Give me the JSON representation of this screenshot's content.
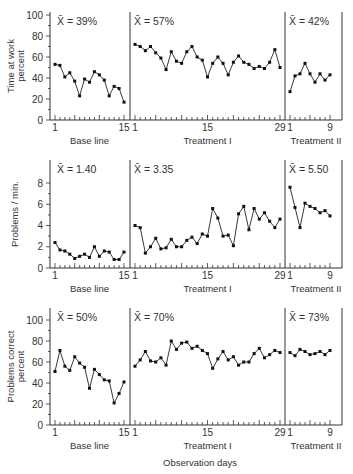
{
  "chart_data": [
    {
      "type": "line",
      "title": "Time at work percent",
      "ylabel": "Time at work percent",
      "ylim": [
        0,
        100
      ],
      "yticks": [
        0,
        20,
        40,
        60,
        80,
        100
      ],
      "phases": [
        {
          "name": "Base line",
          "mean_label": "X̄ = 39%",
          "x_ticks_labeled": [
            1,
            15
          ],
          "values": [
            53,
            52,
            41,
            45,
            37,
            23,
            39,
            36,
            46,
            43,
            38,
            23,
            32,
            30,
            17
          ]
        },
        {
          "name": "Treatment I",
          "mean_label": "X̄ = 57%",
          "x_ticks_labeled": [
            1,
            15,
            29
          ],
          "values": [
            72,
            70,
            66,
            70,
            64,
            59,
            48,
            65,
            56,
            54,
            65,
            70,
            60,
            57,
            41,
            54,
            60,
            54,
            43,
            55,
            61,
            55,
            53,
            49,
            51,
            49,
            55,
            67,
            50
          ]
        },
        {
          "name": "Treatment II",
          "mean_label": "X̄ = 42%",
          "x_ticks_labeled": [
            1,
            9
          ],
          "values": [
            27,
            42,
            44,
            54,
            44,
            36,
            44,
            38,
            43
          ]
        }
      ]
    },
    {
      "type": "line",
      "title": "Problems/min.",
      "ylabel": "Problems / min.",
      "ylim": [
        0,
        10
      ],
      "yticks": [
        0,
        2,
        4,
        6,
        8
      ],
      "phases": [
        {
          "name": "Base line",
          "mean_label": "X̄ = 1.40",
          "x_ticks_labeled": [
            1,
            15
          ],
          "values": [
            2.4,
            1.7,
            1.6,
            1.3,
            0.9,
            1.1,
            1.3,
            1.0,
            2.0,
            1.1,
            1.6,
            1.5,
            0.8,
            0.8,
            1.5
          ]
        },
        {
          "name": "Treatment I",
          "mean_label": "X̄ = 3.35",
          "x_ticks_labeled": [
            1,
            15,
            29
          ],
          "values": [
            4.0,
            3.8,
            1.4,
            2.0,
            2.8,
            1.8,
            1.9,
            2.7,
            2.0,
            2.0,
            2.6,
            2.9,
            2.3,
            3.2,
            3.0,
            5.6,
            4.7,
            3.0,
            3.1,
            2.1,
            5.1,
            5.8,
            3.6,
            5.6,
            4.6,
            5.2,
            4.4,
            3.8,
            4.6
          ]
        },
        {
          "name": "Treatment II",
          "mean_label": "X̄ = 5.50",
          "x_ticks_labeled": [
            1,
            9
          ],
          "values": [
            7.6,
            5.7,
            3.8,
            6.1,
            5.8,
            5.6,
            5.2,
            5.4,
            4.9
          ]
        }
      ]
    },
    {
      "type": "line",
      "title": "Problems correct percent",
      "ylabel": "Problems correct percent",
      "ylim": [
        0,
        100
      ],
      "yticks": [
        0,
        20,
        40,
        60,
        80,
        100
      ],
      "xlabel": "Observation days",
      "phases": [
        {
          "name": "Base line",
          "mean_label": "X̄ = 50%",
          "x_ticks_labeled": [
            1,
            15
          ],
          "values": [
            51,
            71,
            56,
            52,
            65,
            59,
            55,
            35,
            53,
            48,
            43,
            42,
            21,
            30,
            41
          ]
        },
        {
          "name": "Treatment I",
          "mean_label": "X̄ = 70%",
          "x_ticks_labeled": [
            1,
            15,
            29
          ],
          "values": [
            56,
            62,
            70,
            61,
            60,
            64,
            57,
            80,
            72,
            78,
            79,
            73,
            75,
            71,
            68,
            54,
            63,
            70,
            62,
            65,
            57,
            60,
            60,
            68,
            73,
            64,
            67,
            71,
            69
          ]
        },
        {
          "name": "Treatment II",
          "mean_label": "X̄ = 73%",
          "x_ticks_labeled": [
            1,
            9
          ],
          "values": [
            69,
            66,
            72,
            70,
            67,
            68,
            70,
            67,
            71
          ]
        }
      ]
    }
  ]
}
